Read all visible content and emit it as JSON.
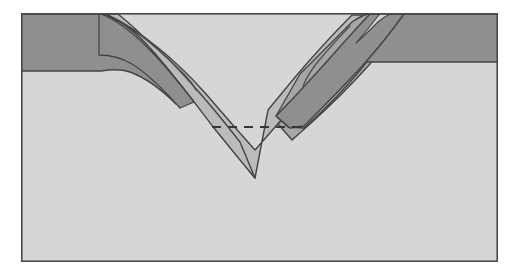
{
  "figure": {
    "title": "Geologic cross section of a V-shaped synclinal fold",
    "type": "geological-cross-section",
    "background_color": "#ffffff",
    "frame": {
      "x": 21,
      "y": 13,
      "width": 477,
      "height": 249,
      "stroke_color": "#4a4a4a",
      "stroke_width": 1.6,
      "fill_color": "#d7d7d7"
    }
  },
  "palette": {
    "basement_light_gray": "#d5d5d5",
    "layer_medium_gray": "#b8b8b8",
    "layer_mid_dark_gray": "#a2a2a2",
    "layer_dark_gray": "#8a8a8a",
    "outline_dark": "#3c3c3c",
    "dashed_line": "#2e2e2e",
    "paper_white": "#ffffff"
  },
  "units": [
    {
      "id": "basement",
      "name": "basement-light-unit",
      "label": "Light gray basement rock",
      "color": "#d5d5d5",
      "description": "Undeformed light gray host rock filling the block beneath and outside the fold"
    },
    {
      "id": "upper-dark-left",
      "name": "dark-layer-left-flank",
      "label": "Dark gray upper layer, left flank",
      "color": "#8a8a8a",
      "base_depth_y": 71,
      "description": "Dark gray stratum capping the left side, truncated where it bends into the trough"
    },
    {
      "id": "upper-dark-right",
      "name": "dark-layer-right-flank",
      "label": "Dark gray upper layer, right flank",
      "color": "#8a8a8a",
      "base_depth_y": 62,
      "description": "Dark gray stratum capping the right side, bending down into the trough"
    },
    {
      "id": "fold-core-medium",
      "name": "medium-gray-fold-core",
      "label": "Medium gray folded layer (syncline core)",
      "color": "#b8b8b8",
      "description": "Medium gray unit forming the V-shaped synclinal core in the center"
    },
    {
      "id": "fold-limb-right",
      "name": "mid-dark-right-limb",
      "label": "Mid-dark gray folded limb, right side",
      "color": "#a2a2a2",
      "description": "Mid-dark wedge on the right limb of the fold dipping toward the axis"
    },
    {
      "id": "hinge-sliver",
      "name": "light-hinge-sliver",
      "label": "Light gray hinge sliver, upper right",
      "color": "#d0d0d0",
      "description": "Thin light colored sliver at the upper right fold hinge"
    }
  ],
  "annotations": {
    "dashed_reference_line": {
      "name": "dashed-reference-line",
      "label": "Dashed horizontal reference line",
      "x_start": 212,
      "x_end": 303,
      "y": 127,
      "color": "#2e2e2e",
      "dash_pattern": "9 7",
      "stroke_width": 2.2
    },
    "axial_trace_left": {
      "name": "axial-trace-left",
      "label": "Thin curved trace within left limb",
      "color": "#4a4a4a"
    },
    "axial_trace_right": {
      "name": "axial-trace-right",
      "label": "Thin curved trace within right limb",
      "color": "#4a4a4a"
    }
  },
  "geometry": {
    "fold_apex": {
      "x": 255,
      "y": 178
    },
    "trough_left_rim_x": 103,
    "trough_right_rim_x": 388,
    "surface_y": 14
  }
}
